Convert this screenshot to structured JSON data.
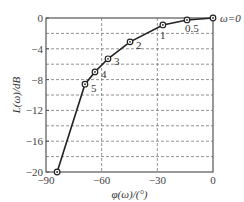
{
  "chart_data": {
    "type": "line",
    "title": "",
    "xlabel": "φ(ω)/(°)",
    "ylabel": "L(ω)/dB",
    "xlim": [
      -90,
      0
    ],
    "ylim": [
      -20,
      0
    ],
    "x_ticks": [
      -90,
      -60,
      -30,
      0
    ],
    "x_tick_labels": [
      "-90",
      "-60",
      "-30",
      "0"
    ],
    "y_ticks": [
      0,
      -4,
      -8,
      -12,
      -16,
      -20
    ],
    "y_tick_labels": [
      "0",
      "-4",
      "-8",
      "-12",
      "-16",
      "-20"
    ],
    "grid": {
      "horizontal_every": 2,
      "vertical_at": [
        -60,
        -30
      ],
      "style": "dashed"
    },
    "series": [
      {
        "name": "Nichols curve",
        "points": [
          {
            "x": -84,
            "y": -20,
            "label": ""
          },
          {
            "x": -69,
            "y": -8.6,
            "label": "5"
          },
          {
            "x": -63.6,
            "y": -7.0,
            "label": "4"
          },
          {
            "x": -56.6,
            "y": -5.3,
            "label": "3"
          },
          {
            "x": -44.7,
            "y": -3.1,
            "label": "2"
          },
          {
            "x": -27,
            "y": -0.9,
            "label": "1"
          },
          {
            "x": -14,
            "y": -0.25,
            "label": "0.5"
          },
          {
            "x": 0,
            "y": 0,
            "label": "ω=0"
          }
        ]
      }
    ],
    "legend": "none"
  }
}
